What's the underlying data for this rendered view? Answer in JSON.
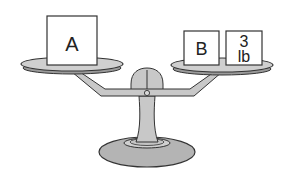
{
  "diagram": {
    "type": "balance-scale",
    "state": "balanced",
    "colors": {
      "metal": "#c8c8c8",
      "metal_dark": "#9a9a9a",
      "outline": "#333333",
      "box_fill": "#ffffff",
      "background": "#ffffff"
    },
    "left_pan": {
      "items": [
        {
          "label": "A"
        }
      ]
    },
    "right_pan": {
      "items": [
        {
          "label": "B"
        },
        {
          "label_line1": "3",
          "label_line2": "lb"
        }
      ]
    }
  }
}
